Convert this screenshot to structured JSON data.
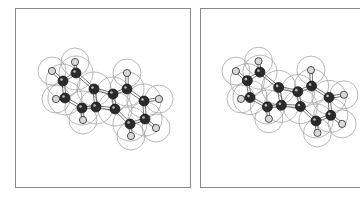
{
  "figure": {
    "type": "stereo-pair",
    "panels": [
      {
        "id": "left",
        "label": ""
      },
      {
        "id": "right",
        "label": ""
      }
    ]
  },
  "molecule": {
    "atoms": [
      {
        "el": "C",
        "x": 62,
        "y": 80
      },
      {
        "el": "C",
        "x": 75,
        "y": 72
      },
      {
        "el": "C",
        "x": 64,
        "y": 97
      },
      {
        "el": "C",
        "x": 93,
        "y": 88
      },
      {
        "el": "C",
        "x": 95,
        "y": 106
      },
      {
        "el": "C",
        "x": 81,
        "y": 107
      },
      {
        "el": "C",
        "x": 112,
        "y": 93
      },
      {
        "el": "C",
        "x": 126,
        "y": 88
      },
      {
        "el": "C",
        "x": 114,
        "y": 108
      },
      {
        "el": "C",
        "x": 143,
        "y": 100
      },
      {
        "el": "C",
        "x": 144,
        "y": 118
      },
      {
        "el": "C",
        "x": 129,
        "y": 123
      },
      {
        "el": "H",
        "x": 51,
        "y": 70
      },
      {
        "el": "H",
        "x": 74,
        "y": 61
      },
      {
        "el": "H",
        "x": 55,
        "y": 98
      },
      {
        "el": "H",
        "x": 82,
        "y": 119
      },
      {
        "el": "H",
        "x": 126,
        "y": 72
      },
      {
        "el": "H",
        "x": 158,
        "y": 98
      },
      {
        "el": "H",
        "x": 130,
        "y": 135
      },
      {
        "el": "H",
        "x": 155,
        "y": 127
      }
    ],
    "bonds": [
      [
        0,
        1
      ],
      [
        0,
        2
      ],
      [
        1,
        3
      ],
      [
        2,
        5
      ],
      [
        3,
        4
      ],
      [
        4,
        5
      ],
      [
        3,
        6
      ],
      [
        6,
        7
      ],
      [
        6,
        8
      ],
      [
        4,
        8
      ],
      [
        7,
        9
      ],
      [
        9,
        10
      ],
      [
        10,
        11
      ],
      [
        11,
        8
      ],
      [
        0,
        12
      ],
      [
        1,
        13
      ],
      [
        2,
        14
      ],
      [
        5,
        15
      ],
      [
        7,
        16
      ],
      [
        9,
        17
      ],
      [
        11,
        18
      ],
      [
        10,
        19
      ]
    ],
    "colors": {
      "carbon": "#2a2a2a",
      "hydrogen": "#d8d8d8",
      "surface": "#9a9a9a",
      "bond": "#555555"
    }
  }
}
